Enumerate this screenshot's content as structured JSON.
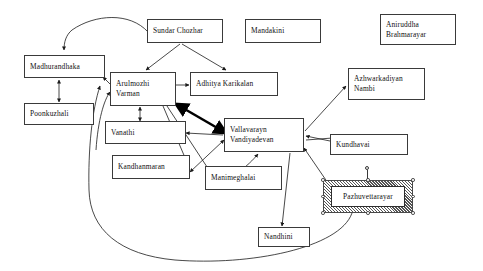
{
  "diagram": {
    "type": "character-relationship-diagram",
    "background_color": "#ffffff",
    "node_border_color": "#3a3a3a",
    "edge_color": "#1a1a1a",
    "nodes": [
      {
        "id": "madhurandhaka",
        "label_line1": "Madhurandhaka",
        "label_line2": ""
      },
      {
        "id": "poonkuzhali",
        "label_line1": "Poonkuzhali",
        "label_line2": ""
      },
      {
        "id": "sundar_chozhar",
        "label_line1": "Sundar Chozhar",
        "label_line2": ""
      },
      {
        "id": "mandakini",
        "label_line1": "Mandakini",
        "label_line2": ""
      },
      {
        "id": "aniruddha",
        "label_line1": "Aniruddha",
        "label_line2": "Brahmarayar"
      },
      {
        "id": "arulmozhi",
        "label_line1": "Arulmozhi",
        "label_line2": "Varman"
      },
      {
        "id": "adhitya",
        "label_line1": "Adhitya Karikalan",
        "label_line2": ""
      },
      {
        "id": "vanathi",
        "label_line1": "Vanathi",
        "label_line2": ""
      },
      {
        "id": "kandhanmaran",
        "label_line1": "Kandhanmaran",
        "label_line2": ""
      },
      {
        "id": "vallavarayn",
        "label_line1": "Vallavarayn",
        "label_line2": "Vandiyadevan"
      },
      {
        "id": "manimeghalai",
        "label_line1": "Manimeghalai",
        "label_line2": ""
      },
      {
        "id": "azhwarkadiyan",
        "label_line1": "Azhwarkadiyan",
        "label_line2": "Nambi"
      },
      {
        "id": "kundhavai",
        "label_line1": "Kundhavai",
        "label_line2": ""
      },
      {
        "id": "nandhini",
        "label_line1": "Nandhini",
        "label_line2": ""
      },
      {
        "id": "pazhuvettarayar",
        "label_line1": "Pazhuvettarayar",
        "label_line2": ""
      }
    ],
    "selected_node": "pazhuvettarayar",
    "edges": [
      {
        "from": "sundar_chozhar",
        "to": "madhurandhaka",
        "style": "curved",
        "arrows": "single"
      },
      {
        "from": "sundar_chozhar",
        "to": "arulmozhi",
        "style": "straight",
        "arrows": "single"
      },
      {
        "from": "sundar_chozhar",
        "to": "adhitya",
        "style": "straight",
        "arrows": "single"
      },
      {
        "from": "madhurandhaka",
        "to": "poonkuzhali",
        "style": "straight",
        "arrows": "double"
      },
      {
        "from": "arulmozhi",
        "to": "madhurandhaka",
        "style": "straight",
        "arrows": "single"
      },
      {
        "from": "arulmozhi",
        "to": "adhitya",
        "style": "straight",
        "arrows": "single"
      },
      {
        "from": "arulmozhi",
        "to": "vanathi",
        "style": "straight",
        "arrows": "double"
      },
      {
        "from": "arulmozhi",
        "to": "vallavarayn",
        "style": "straight",
        "arrows": "double",
        "weight": "thick"
      },
      {
        "from": "arulmozhi",
        "to": "manimeghalai",
        "style": "straight",
        "arrows": "single"
      },
      {
        "from": "arulmozhi",
        "to": "kandhanmaran",
        "style": "straight",
        "arrows": "single"
      },
      {
        "from": "vallavarayn",
        "to": "vanathi",
        "style": "straight",
        "arrows": "single"
      },
      {
        "from": "vallavarayn",
        "to": "kandhanmaran",
        "style": "straight",
        "arrows": "double"
      },
      {
        "from": "vallavarayn",
        "to": "azhwarkadiyan",
        "style": "straight",
        "arrows": "single"
      },
      {
        "from": "vallavarayn",
        "to": "nandhini",
        "style": "straight",
        "arrows": "single"
      },
      {
        "from": "manimeghalai",
        "to": "vallavarayn",
        "style": "curved",
        "arrows": "single"
      },
      {
        "from": "kundhavai",
        "to": "vallavarayn",
        "style": "straight",
        "arrows": "single"
      },
      {
        "from": "vallavarayn",
        "to": "kundhavai",
        "style": "straight",
        "arrows": "single"
      },
      {
        "from": "pazhuvettarayar",
        "to": "vallavarayn",
        "style": "straight",
        "arrows": "single"
      },
      {
        "from": "pazhuvettarayar",
        "to": "madhurandhaka",
        "style": "curved-long",
        "arrows": "single"
      },
      {
        "from": "pazhuvettarayar",
        "to": "arulmozhi",
        "style": "curved-long",
        "arrows": "single"
      }
    ]
  }
}
